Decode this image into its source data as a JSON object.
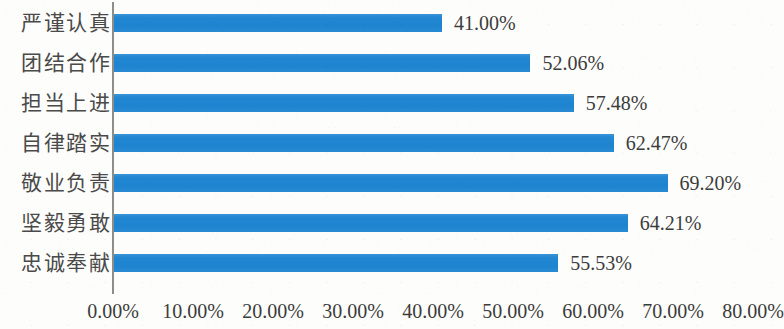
{
  "chart_data": {
    "type": "bar",
    "orientation": "horizontal",
    "title": "",
    "xlabel": "",
    "ylabel": "",
    "categories": [
      "严谨认真",
      "团结合作",
      "担当上进",
      "自律踏实",
      "敬业负责",
      "坚毅勇敢",
      "忠诚奉献"
    ],
    "values": [
      41.0,
      52.06,
      57.48,
      62.47,
      69.2,
      64.21,
      55.53
    ],
    "value_labels": [
      "41.00%",
      "52.06%",
      "57.48%",
      "62.47%",
      "69.20%",
      "64.21%",
      "55.53%"
    ],
    "xlim": [
      0,
      80
    ],
    "xticks": [
      0,
      10,
      20,
      30,
      40,
      50,
      60,
      70,
      80
    ],
    "xtick_labels": [
      "0.00%",
      "10.00%",
      "20.00%",
      "30.00%",
      "40.00%",
      "50.00%",
      "60.00%",
      "70.00%",
      "80.00%"
    ],
    "grid": false,
    "legend": false,
    "series_color": "#2387d2",
    "axis_color": "#8d8d8a",
    "text_color": "#3c3c3c",
    "background_color": "#fdfdfb"
  }
}
